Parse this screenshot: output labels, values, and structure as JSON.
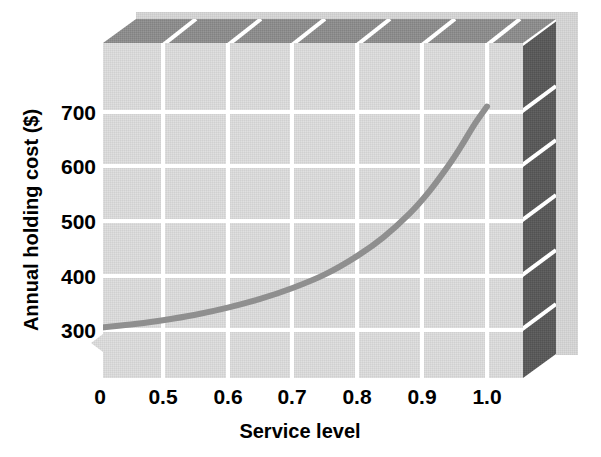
{
  "chart_data": {
    "type": "line",
    "title": "",
    "subtitle": "",
    "xlabel": "Service level",
    "ylabel": "Annual holding cost ($)",
    "xlim": [
      0.35,
      1.08
    ],
    "ylim": [
      255,
      790
    ],
    "xticks": [
      "0",
      "0.5",
      "0.6",
      "0.7",
      "0.8",
      "0.9",
      "1.0"
    ],
    "xtick_values": [
      0.0,
      0.5,
      0.6,
      0.7,
      0.8,
      0.9,
      1.0
    ],
    "yticks": [
      "300",
      "400",
      "500",
      "600",
      "700"
    ],
    "ytick_values": [
      300,
      400,
      500,
      600,
      700
    ],
    "grid": true,
    "grid_color": "#ffffff",
    "legend": null,
    "axis_break": true,
    "series": [
      {
        "name": "Annual holding cost",
        "color": "#8f8f8f",
        "line_width": 6,
        "x": [
          0.37,
          0.4,
          0.45,
          0.5,
          0.55,
          0.6,
          0.65,
          0.7,
          0.75,
          0.8,
          0.84,
          0.88,
          0.91,
          0.94,
          0.96,
          0.98,
          1.0
        ],
        "y": [
          301,
          304,
          310,
          318,
          328,
          341,
          357,
          377,
          402,
          436,
          470,
          513,
          553,
          601,
          637,
          676,
          710
        ]
      }
    ]
  },
  "figure": {
    "background": "#ffffff",
    "plot_face_color": "#d8d8d8",
    "top_face_color": "#8c8c8c",
    "side_face_color": "#5a5a5a",
    "back_panel_color": "#d2d2d2",
    "gridline_color": "#ffffff",
    "text_color": "#000000"
  },
  "axes": {
    "x_tick_0": "0",
    "x_tick_1": "0.5",
    "x_tick_2": "0.6",
    "x_tick_3": "0.7",
    "x_tick_4": "0.8",
    "x_tick_5": "0.9",
    "x_tick_6": "1.0",
    "y_tick_0": "300",
    "y_tick_1": "400",
    "y_tick_2": "500",
    "y_tick_3": "600",
    "y_tick_4": "700",
    "x_axis_title": "Service level",
    "y_axis_title": "Annual holding cost ($)"
  }
}
